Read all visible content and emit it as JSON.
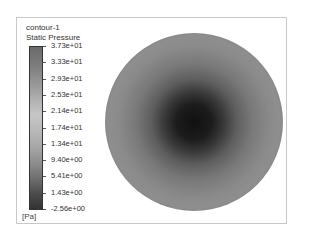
{
  "chart_data": {
    "type": "heatmap",
    "title": "contour-1",
    "subtitle": "Static Pressure",
    "unit": "[Pa]",
    "colorbar": {
      "labels": [
        "3.73e+01",
        "3.33e+01",
        "2.93e+01",
        "2.53e+01",
        "2.14e+01",
        "1.74e+01",
        "1.34e+01",
        "9.40e+00",
        "5.41e+00",
        "1.43e+00",
        "-2.56e+00"
      ],
      "min": -2.56,
      "max": 37.3,
      "colormap": "grayscale"
    },
    "field": {
      "shape": "circle",
      "description": "Radially symmetric pressure: minimum (dark) at center, brighter ring at mid-radius, darker toward rim"
    }
  },
  "legend": {
    "title": "contour-1",
    "variable": "Static Pressure",
    "unit": "[Pa]"
  }
}
